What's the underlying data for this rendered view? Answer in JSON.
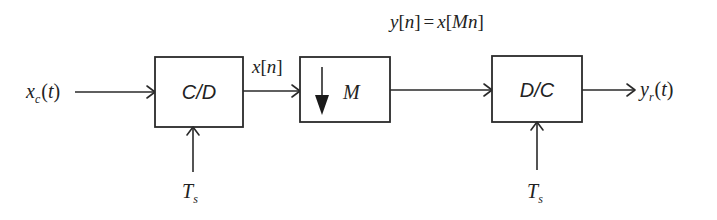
{
  "diagram": {
    "title_equation": {
      "lhs": "y",
      "lhs_idx": "n",
      "eq": "=",
      "rhs": "x",
      "rhs_idx": "Mn"
    },
    "input": {
      "symbol": "x",
      "subscript": "c",
      "arg": "(t)"
    },
    "output": {
      "symbol": "y",
      "subscript": "r",
      "arg": "(t)"
    },
    "blocks": [
      {
        "id": "cd",
        "label": "C/D"
      },
      {
        "id": "down",
        "label": "M",
        "icon": "down-arrow-icon"
      },
      {
        "id": "dc",
        "label": "D/C"
      }
    ],
    "signals": {
      "discrete": {
        "symbol": "x",
        "idx": "n"
      }
    },
    "control_inputs": [
      {
        "symbol": "T",
        "subscript": "s"
      },
      {
        "symbol": "T",
        "subscript": "s"
      }
    ]
  }
}
